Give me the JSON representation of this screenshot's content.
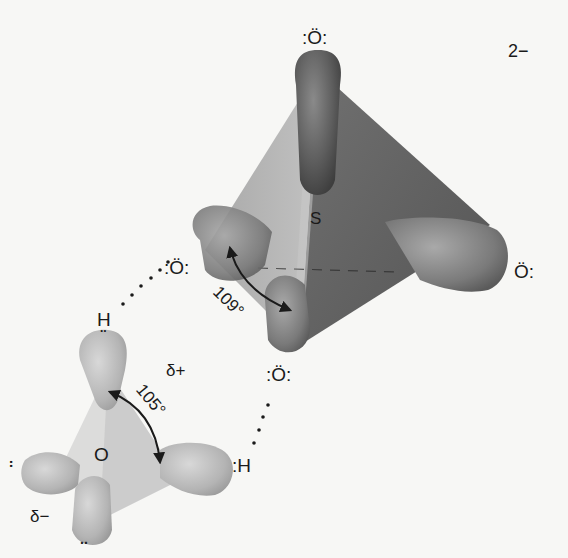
{
  "diagram": {
    "sulfate": {
      "central_atom": "S",
      "charge": "2−",
      "oxygens": [
        {
          "id": "top",
          "label": ":Ö:"
        },
        {
          "id": "left",
          "label": ":Ö:"
        },
        {
          "id": "right",
          "label": "Ö:"
        },
        {
          "id": "bottom",
          "label": ":Ö:"
        }
      ],
      "bond_angle": "109°"
    },
    "water": {
      "central_atom": "O",
      "hydrogens": [
        {
          "id": "top",
          "label": "H"
        },
        {
          "id": "right",
          "label": ":H"
        }
      ],
      "bond_angle": "105°",
      "partial_positive": "δ+",
      "partial_negative": "δ−",
      "lone_pair_mark": ".."
    },
    "hydrogen_bonds": [
      {
        "from": "water.H.top",
        "to": "sulfate.O.left"
      },
      {
        "from": "water.H.right",
        "to": "sulfate.O.bottom"
      }
    ],
    "colors": {
      "background": "#f7f7f5",
      "sulfate_dark": "#5a5a5a",
      "sulfate_mid": "#7d7d7d",
      "sulfate_light": "#a8a8a8",
      "water_fill": "#bdbdbd",
      "water_light": "#d6d6d6",
      "text": "#1a1a1a"
    }
  }
}
